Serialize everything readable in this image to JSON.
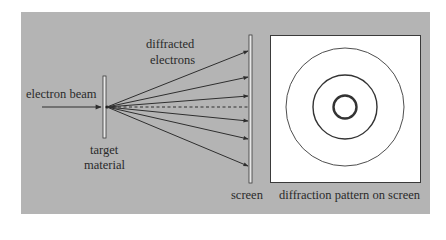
{
  "figure": {
    "panel_color": "#b4b4b4",
    "pattern_bg": "#ffffff",
    "line_color": "#2e2e2e"
  },
  "labels": {
    "electron_beam": "electron beam",
    "diffracted_line1": "diffracted",
    "diffracted_line2": "electrons",
    "target_line1": "target",
    "target_line2": "material",
    "screen": "screen",
    "pattern": "diffraction pattern on screen"
  },
  "rays": {
    "count": 7,
    "center_dashed": true,
    "arrow_targets_y": [
      52,
      77,
      96,
      129,
      153,
      177
    ]
  },
  "rings": {
    "count": 3,
    "radii_px": [
      12,
      32,
      59
    ]
  }
}
